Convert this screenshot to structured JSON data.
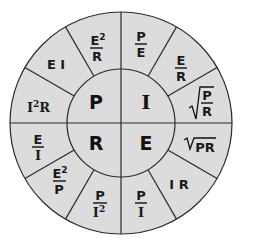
{
  "diagram": {
    "colors": {
      "fill": "#dcdcdc",
      "stroke": "#2a2a2a",
      "text": "#111111"
    },
    "center_quadrants": [
      {
        "id": "top-left",
        "label": "P"
      },
      {
        "id": "top-right",
        "label": "I"
      },
      {
        "id": "bottom-left",
        "label": "R"
      },
      {
        "id": "bottom-right",
        "label": "E"
      }
    ],
    "outer_segments": {
      "P": [
        {
          "formula": "I²R",
          "parts": {
            "base": "I",
            "sup": "2",
            "tail": "R"
          }
        },
        {
          "formula": "EI",
          "text": "E I"
        },
        {
          "formula": "E²/R",
          "num": "E",
          "num_sup": "2",
          "den": "R"
        }
      ],
      "I": [
        {
          "formula": "P/E",
          "num": "P",
          "den": "E"
        },
        {
          "formula": "E/R",
          "num": "E",
          "den": "R"
        },
        {
          "formula": "√(P/R)",
          "num": "P",
          "den": "R"
        }
      ],
      "E": [
        {
          "formula": "√(PR)",
          "text": "PR"
        },
        {
          "formula": "IR",
          "text": "I R"
        },
        {
          "formula": "P/I",
          "num": "P",
          "den": "I"
        }
      ],
      "R": [
        {
          "formula": "P/I²",
          "num": "P",
          "den": "I",
          "den_sup": "2"
        },
        {
          "formula": "E²/P",
          "num": "E",
          "num_sup": "2",
          "den": "P"
        },
        {
          "formula": "E/I",
          "num": "E",
          "den": "I"
        }
      ]
    }
  }
}
